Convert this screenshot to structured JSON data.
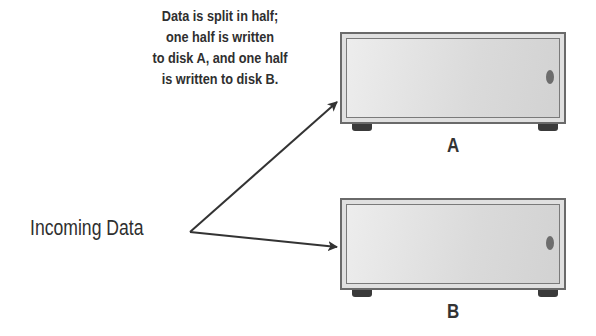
{
  "caption": {
    "lines": [
      "Data is split in half;",
      "one half is written",
      "to disk A, and one half",
      "is written to disk B."
    ]
  },
  "source_label": "Incoming Data",
  "disks": [
    {
      "label": "A"
    },
    {
      "label": "B"
    }
  ],
  "colors": {
    "text": "#2f2f2f",
    "arrow": "#333333",
    "disk_fill": "#e0e0e0",
    "disk_border": "#6a6a6a"
  }
}
